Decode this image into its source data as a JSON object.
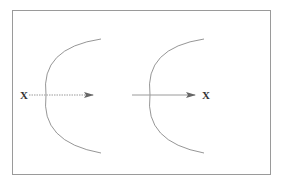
{
  "diagram": {
    "frame": {
      "x": 12,
      "y": 10,
      "width": 258,
      "height": 164,
      "stroke": "#9a9a9a"
    },
    "left_panel": {
      "object_label": "X",
      "object_pos": {
        "x": 23,
        "y": 99
      },
      "ray": {
        "x1": 29,
        "x2": 93,
        "y": 95,
        "style": "dotted"
      },
      "mirror_arc": {
        "top": [
          101,
          39
        ],
        "bottom": [
          101,
          153
        ],
        "leftmost": [
          46,
          95
        ]
      }
    },
    "right_panel": {
      "image_label": "X",
      "image_pos": {
        "x": 205,
        "y": 99
      },
      "ray": {
        "x1": 132,
        "x2": 195,
        "y": 95,
        "style": "solid"
      },
      "mirror_arc": {
        "top": [
          204,
          39
        ],
        "bottom": [
          204,
          153
        ],
        "leftmost": [
          150,
          95
        ]
      }
    },
    "colors": {
      "arc": "#8a8a8a",
      "ray": "#9a9a9a",
      "arrowhead": "#666666",
      "label": "#333333"
    }
  }
}
